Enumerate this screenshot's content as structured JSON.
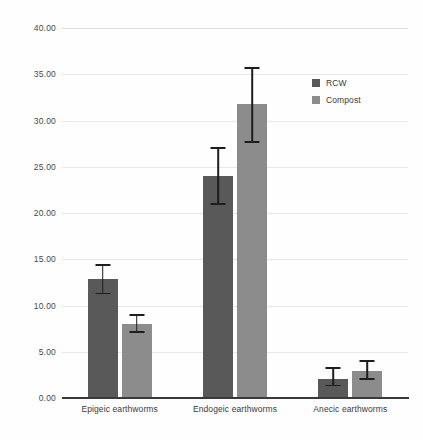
{
  "chart_data": {
    "type": "bar",
    "title": "",
    "subtitle": "",
    "xlabel": "",
    "ylabel": "",
    "categories": [
      "Epigeic earthworms",
      "Endogeic earthworms",
      "Anecic earthworms"
    ],
    "series": [
      {
        "name": "RCW",
        "color": "#595959",
        "values": [
          12.9,
          24.05,
          2.05
        ],
        "error_low": [
          11.2,
          20.9,
          1.25
        ],
        "error_high": [
          14.5,
          27.1,
          3.3
        ]
      },
      {
        "name": "Compost",
        "color": "#8c8c8c",
        "values": [
          8.0,
          31.8,
          2.9
        ],
        "error_low": [
          7.0,
          27.6,
          2.0
        ],
        "error_high": [
          9.05,
          35.8,
          4.1
        ]
      }
    ],
    "ylim": [
      0,
      40
    ],
    "ytick_step": 5,
    "ytick_labels": [
      "0.00",
      "5.00",
      "10.00",
      "15.00",
      "20.00",
      "25.00",
      "30.00",
      "35.00",
      "40.00"
    ],
    "ytick_values": [
      0,
      5,
      10,
      15,
      20,
      25,
      30,
      35,
      40
    ],
    "grid": true,
    "legend_position": "top-right",
    "error_bar_style": "capped",
    "background_color": "#fefefe",
    "gridline_color": "#e8e8e8",
    "axis_color": "#3a3a3a"
  }
}
